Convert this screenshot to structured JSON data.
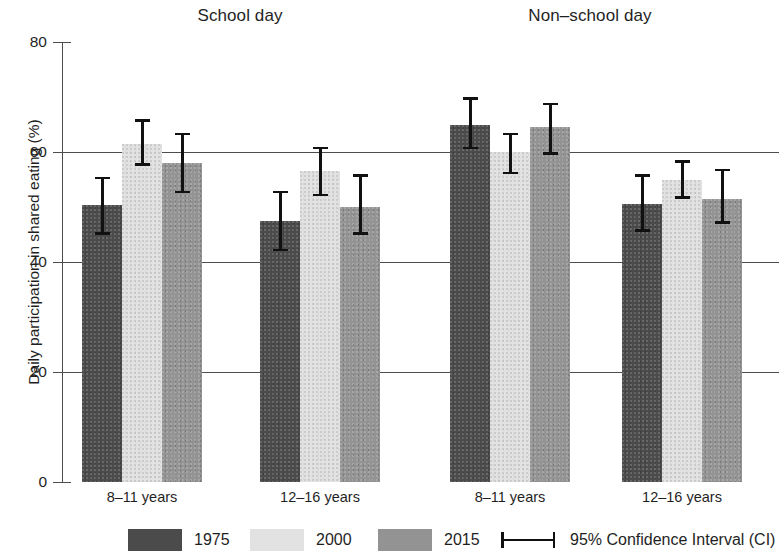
{
  "chart_data": {
    "type": "bar",
    "title": "",
    "xlabel": "",
    "ylabel": "Daily participation in shared eating (%)",
    "ylim": [
      0,
      80
    ],
    "yticks": [
      0,
      20,
      40,
      60,
      80
    ],
    "ytick_labels": [
      "0",
      "20",
      "40",
      "60",
      "80"
    ],
    "grid": "horizontal gridlines at 20, 40, 60",
    "legend_position": "bottom",
    "panels": [
      {
        "title": "School day",
        "categories": [
          "8–11 years",
          "12–16 years"
        ]
      },
      {
        "title": "Non–school day",
        "categories": [
          "8–11 years",
          "12–16 years"
        ]
      }
    ],
    "categories": [
      "School day / 8–11 years",
      "School day / 12–16 years",
      "Non–school day / 8–11 years",
      "Non–school day / 12–16 years"
    ],
    "series": [
      {
        "name": "1975",
        "color": "#4b4b4b",
        "values": [
          50.3,
          47.5,
          65.0,
          50.5
        ],
        "ci_low": [
          45.0,
          42.0,
          60.5,
          45.5
        ],
        "ci_high": [
          55.5,
          53.0,
          70.0,
          56.0
        ]
      },
      {
        "name": "2000",
        "color": "#e2e2e2",
        "values": [
          61.5,
          56.5,
          60.0,
          55.0
        ],
        "ci_low": [
          57.5,
          52.0,
          56.0,
          51.5
        ],
        "ci_high": [
          66.0,
          61.0,
          63.5,
          58.5
        ]
      },
      {
        "name": "2015",
        "color": "#939393",
        "values": [
          58.0,
          50.0,
          64.5,
          51.5
        ],
        "ci_low": [
          52.5,
          45.0,
          59.5,
          47.0
        ],
        "ci_high": [
          63.5,
          56.0,
          69.0,
          57.0
        ]
      }
    ],
    "error_legend": "95% Confidence Interval (CI)"
  },
  "figure": {
    "panel_titles": {
      "school": "School day",
      "nonschool": "Non–school day"
    },
    "y_axis_label": "Daily participation in shared eating (%)",
    "y_ticks": [
      "80",
      "60",
      "40",
      "20",
      "0"
    ],
    "group_labels": [
      "8–11 years",
      "12–16 years",
      "8–11 years",
      "12–16 years"
    ],
    "legend": {
      "items": [
        {
          "label": "1975",
          "color": "#4b4b4b"
        },
        {
          "label": "2000",
          "color": "#e2e2e2"
        },
        {
          "label": "2015",
          "color": "#939393"
        }
      ],
      "ci_label": "95% Confidence Interval (CI)"
    }
  }
}
